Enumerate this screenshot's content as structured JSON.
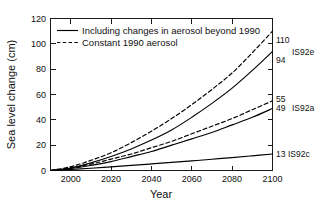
{
  "chart_data": {
    "type": "line",
    "title": "",
    "xlabel": "Year",
    "ylabel": "Sea level change (cm)",
    "xlim": [
      1990,
      2100
    ],
    "ylim": [
      0,
      120
    ],
    "xticks": [
      2000,
      2020,
      2040,
      2060,
      2080,
      2100
    ],
    "yticks": [
      0,
      20,
      40,
      60,
      80,
      100,
      120
    ],
    "grid": false,
    "legend_position": "upper-left-inside",
    "x": [
      1990,
      2000,
      2010,
      2020,
      2030,
      2040,
      2050,
      2060,
      2070,
      2080,
      2090,
      2100
    ],
    "series": [
      {
        "name": "IS92e constant 1990 aerosol",
        "style": "dashed",
        "scenario": "IS92e",
        "end_label": "110",
        "values": [
          0,
          3,
          8,
          14,
          22,
          31,
          41,
          52,
          64,
          77,
          93,
          110
        ]
      },
      {
        "name": "IS92e including changes in aerosol beyond 1990",
        "style": "solid",
        "scenario": "IS92e",
        "end_label": "94",
        "values": [
          0,
          2,
          6,
          11,
          17,
          24,
          32,
          42,
          53,
          65,
          79,
          94
        ]
      },
      {
        "name": "IS92a constant 1990 aerosol",
        "style": "dashed",
        "scenario": "IS92a",
        "end_label": "55",
        "values": [
          0,
          2,
          5,
          9,
          13,
          18,
          23,
          29,
          35,
          41,
          48,
          55
        ]
      },
      {
        "name": "IS92a including changes in aerosol beyond 1990",
        "style": "solid",
        "scenario": "IS92a",
        "end_label": "49",
        "values": [
          0,
          1.5,
          4,
          7,
          11,
          15,
          20,
          25,
          30,
          36,
          42,
          49
        ]
      },
      {
        "name": "IS92c including changes in aerosol beyond 1990",
        "style": "solid",
        "scenario": "IS92c",
        "end_label": "13",
        "values": [
          0,
          0.8,
          1.8,
          2.9,
          4.0,
          5.2,
          6.4,
          7.6,
          8.9,
          10.2,
          11.6,
          13
        ]
      }
    ],
    "right_labels": [
      {
        "value": "110",
        "scenario": "IS92e",
        "y": 110
      },
      {
        "value": "94",
        "scenario": "",
        "y": 94
      },
      {
        "value": "55",
        "scenario": "IS92a",
        "y": 55
      },
      {
        "value": "49",
        "scenario": "",
        "y": 49
      },
      {
        "value": "13",
        "scenario": "IS92c",
        "y": 13
      }
    ],
    "legend": [
      {
        "label": "Including changes in aerosol beyond 1990",
        "style": "solid"
      },
      {
        "label": "Constant 1990 aerosol",
        "style": "dashed"
      }
    ],
    "colors": {
      "line": "#000000",
      "axis": "#1a1a1a",
      "text": "#111111"
    }
  },
  "axis": {
    "ytick_0": "0",
    "ytick_20": "20",
    "ytick_40": "40",
    "ytick_60": "60",
    "ytick_80": "80",
    "ytick_100": "100",
    "ytick_120": "120",
    "xtick_2000": "2000",
    "xtick_2020": "2020",
    "xtick_2040": "2040",
    "xtick_2060": "2060",
    "xtick_2080": "2080",
    "xtick_2100": "2100",
    "xlabel": "Year",
    "ylabel": "Sea level change (cm)"
  },
  "legend": {
    "entry_solid": "Including changes in aerosol beyond 1990",
    "entry_dashed": "Constant 1990 aerosol"
  },
  "right_labels": {
    "e_dashed": "110",
    "e_scenario": "IS92e",
    "e_solid": "94",
    "a_dashed": "55",
    "a_scenario": "IS92a",
    "a_solid": "49",
    "c_solid": "13",
    "c_scenario": "IS92c"
  }
}
